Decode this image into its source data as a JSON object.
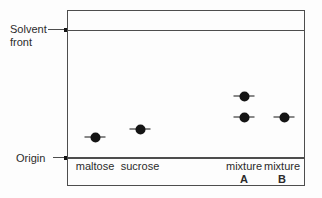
{
  "figure": {
    "type": "paper-chromatography-diagram",
    "solvent_front_label": "Solvent\nfront",
    "origin_label": "Origin",
    "lanes": [
      {
        "name": "maltose",
        "label": "maltose",
        "sublabel": "",
        "x": 27
      },
      {
        "name": "sucrose",
        "label": "sucrose",
        "sublabel": "",
        "x": 72
      },
      {
        "name": "mixture-a",
        "label": "mixture",
        "sublabel": "A",
        "x": 176
      },
      {
        "name": "mixture-b",
        "label": "mixture",
        "sublabel": "B",
        "x": 214
      }
    ],
    "spots": [
      {
        "lane": "maltose",
        "x": 27,
        "y": 126
      },
      {
        "lane": "sucrose",
        "x": 72,
        "y": 118
      },
      {
        "lane": "mixture-a",
        "x": 176,
        "y": 85
      },
      {
        "lane": "mixture-a",
        "x": 176,
        "y": 106
      },
      {
        "lane": "mixture-b",
        "x": 216,
        "y": 106
      }
    ],
    "colors": {
      "line": "#4d4d4d",
      "spot": "#141414",
      "text": "#2b2b2b",
      "background": "#fdfdfd"
    }
  }
}
